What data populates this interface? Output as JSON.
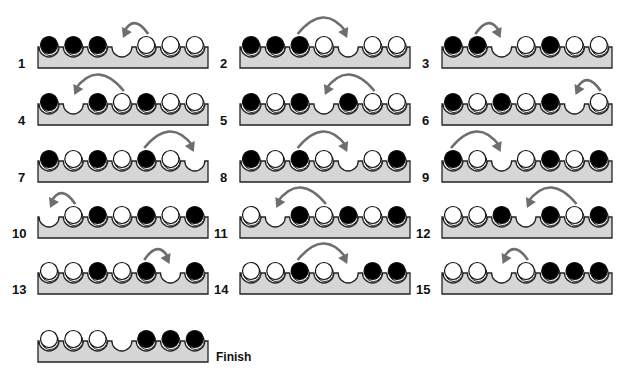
{
  "colors": {
    "board_fill": "#d6d6d6",
    "board_stroke": "#222222",
    "black_peg": "#000000",
    "white_peg": "#ffffff",
    "arrow": "#6e6e6e"
  },
  "legend": {
    "B": "black peg",
    "W": "white peg",
    "_": "empty hole"
  },
  "steps": [
    {
      "label": "1",
      "state": "BBB_WWW",
      "move": {
        "from": 4,
        "to": 3,
        "dir": "left"
      }
    },
    {
      "label": "2",
      "state": "BBBW_WW",
      "move": {
        "from": 2,
        "to": 4,
        "dir": "right"
      }
    },
    {
      "label": "3",
      "state": "BB_WBWW",
      "move": {
        "from": 1,
        "to": 2,
        "dir": "right"
      }
    },
    {
      "label": "4",
      "state": "B_BWBWW",
      "move": {
        "from": 3,
        "to": 1,
        "dir": "left"
      }
    },
    {
      "label": "5",
      "state": "BWB_BWW",
      "move": {
        "from": 5,
        "to": 3,
        "dir": "left"
      }
    },
    {
      "label": "6",
      "state": "BWBWB_W",
      "move": {
        "from": 6,
        "to": 5,
        "dir": "left"
      }
    },
    {
      "label": "7",
      "state": "BWBWBW_",
      "move": {
        "from": 4,
        "to": 6,
        "dir": "right"
      }
    },
    {
      "label": "8",
      "state": "BWBW_WB",
      "move": {
        "from": 2,
        "to": 4,
        "dir": "right"
      }
    },
    {
      "label": "9",
      "state": "BW_WBWB",
      "move": {
        "from": 0,
        "to": 2,
        "dir": "right"
      }
    },
    {
      "label": "10",
      "state": "_WBWBWB",
      "move": {
        "from": 1,
        "to": 0,
        "dir": "left"
      }
    },
    {
      "label": "11",
      "state": "W_BWBWB",
      "move": {
        "from": 3,
        "to": 1,
        "dir": "left"
      }
    },
    {
      "label": "12",
      "state": "WWB_BWB",
      "move": {
        "from": 5,
        "to": 3,
        "dir": "left"
      }
    },
    {
      "label": "13",
      "state": "WWBWB_B",
      "move": {
        "from": 4,
        "to": 5,
        "dir": "right"
      }
    },
    {
      "label": "14",
      "state": "WWBW_BB",
      "move": {
        "from": 2,
        "to": 4,
        "dir": "right"
      }
    },
    {
      "label": "15",
      "state": "WW_WBBB",
      "move": {
        "from": 3,
        "to": 2,
        "dir": "left"
      }
    }
  ],
  "finish": {
    "label": "Finish",
    "state": "WWW_BBB"
  }
}
